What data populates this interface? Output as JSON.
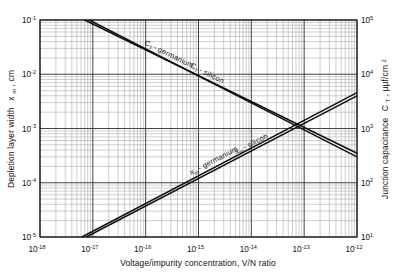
{
  "figure": {
    "background": "#ffffff",
    "ink": "#111111",
    "grid_major_color": "#3a3a3a",
    "grid_minor_color": "#8f8f8f",
    "curve_color": "#111111"
  },
  "chart_data": {
    "type": "line",
    "title": "",
    "xlabel": "Voltage/impurity concentration, V/N ratio",
    "ylabel": "Depletion layer width xₘ, cm",
    "y2label": "Junction capacitance Cₜ, μμf/cm²",
    "xscale": "log",
    "yscale": "log",
    "y2scale": "log",
    "xlim": [
      1e-18,
      1e-12
    ],
    "ylim": [
      1e-05,
      0.1
    ],
    "y2lim": [
      10,
      100000
    ],
    "grid": "log-log minor and major gridlines",
    "legend": "inline curve labels",
    "xticks": [
      "10⁻¹⁸",
      "10⁻¹⁷",
      "10⁻¹⁶",
      "10⁻¹⁵",
      "10⁻¹⁴",
      "10⁻¹³",
      "10⁻¹²"
    ],
    "xtick_mantissa": [
      "10",
      "10",
      "10",
      "10",
      "10",
      "10",
      "10"
    ],
    "xtick_exponents": [
      "-18",
      "-17",
      "-16",
      "-15",
      "-14",
      "-13",
      "-12"
    ],
    "ytick_mantissa": [
      "10",
      "10",
      "10",
      "10",
      "10"
    ],
    "ytick_exponents": [
      "-1",
      "-2",
      "-3",
      "-4",
      "-5"
    ],
    "y2tick_mantissa": [
      "10",
      "10",
      "10",
      "10",
      "10"
    ],
    "y2tick_exponents": [
      "5",
      "4",
      "3",
      "2",
      "1"
    ],
    "series": [
      {
        "name": "Cₜ - germanium",
        "label": "C",
        "label_sub": "T",
        "label_tail": "- germanium",
        "axis": "right",
        "slope": "negative",
        "x": [
          7e-18,
          1e-12
        ],
        "y": [
          0.1,
          0.00035
        ]
      },
      {
        "name": "Cₜ - silicon",
        "label": "C",
        "label_sub": "T",
        "label_tail": "- silicon",
        "axis": "right",
        "slope": "negative",
        "x": [
          8.5e-18,
          1e-12
        ],
        "y": [
          0.1,
          0.0003
        ]
      },
      {
        "name": "xₘ - germanium",
        "label": "x",
        "label_sub": "m",
        "label_tail": "- germanium",
        "axis": "left",
        "slope": "positive",
        "x": [
          6.2e-18,
          1e-12
        ],
        "y": [
          1e-05,
          0.0046
        ]
      },
      {
        "name": "xₘ - silicon",
        "label": "x",
        "label_sub": "m",
        "label_tail": "- silicon",
        "axis": "left",
        "slope": "positive",
        "x": [
          7.5e-18,
          1e-12
        ],
        "y": [
          1e-05,
          0.004
        ]
      }
    ],
    "crossing_point": {
      "x": 1.3e-13,
      "y": 0.00115
    }
  },
  "labels": {
    "ylabel_main": "Depletion layer width",
    "ylabel_var": "x",
    "ylabel_var_sub": "m",
    "ylabel_unit": ", cm",
    "y2label_main": "Junction capacitance",
    "y2label_var": "C",
    "y2label_var_sub": "T",
    "y2label_unit": ", μμf/cm",
    "y2label_unit_sup": "2",
    "xlabel_full": "Voltage/impurity concentration, V/N ratio"
  }
}
